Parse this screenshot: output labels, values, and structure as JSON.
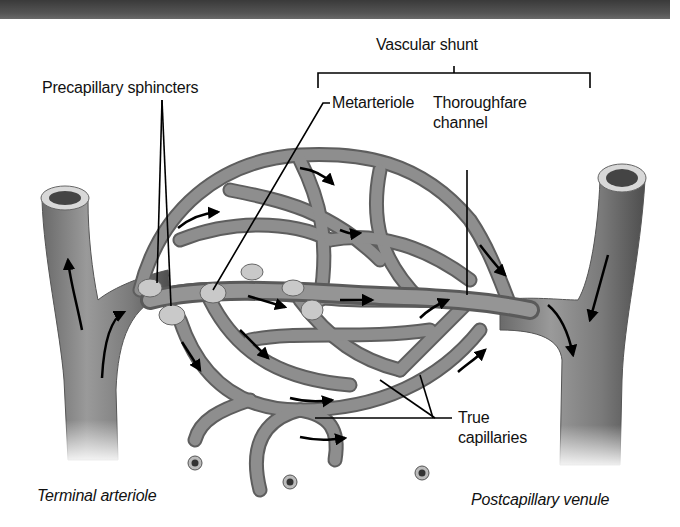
{
  "figure": {
    "labels": {
      "vascular_shunt": "Vascular shunt",
      "precapillary_sphincters": "Precapillary sphincters",
      "metarteriole": "Metarteriole",
      "thoroughfare_channel_line1": "Thoroughfare",
      "thoroughfare_channel_line2": "channel",
      "true_capillaries_line1": "True",
      "true_capillaries_line2": "capillaries",
      "terminal_arteriole": "Terminal arteriole",
      "postcapillary_venule": "Postcapillary venule"
    },
    "colors": {
      "vessel_fill": "#8a8a8a",
      "vessel_dark": "#5e5e5e",
      "vessel_light": "#b4b4b4",
      "lumen": "#444444",
      "header_bar": "#4a4a4a",
      "text": "#111111",
      "background": "#ffffff"
    },
    "flow_direction": "Terminal arteriole → capillary bed → Postcapillary venule"
  }
}
